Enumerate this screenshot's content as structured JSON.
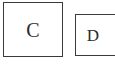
{
  "canvas": {
    "width": 115,
    "height": 64,
    "background_color": "#ffffff"
  },
  "diagram": {
    "title": "",
    "kind": "labeled-box-pair",
    "border_color": "#3a3a3a",
    "label_color": "#2b2b2b",
    "nodes": [
      {
        "id": "c",
        "label": "C",
        "x": 3,
        "y": 2,
        "width": 60,
        "height": 55,
        "fill": "#ffffff",
        "clipped": false
      },
      {
        "id": "d",
        "label": "D",
        "x": 75,
        "y": 14,
        "width": 48,
        "height": 42,
        "fill": "#ffffff",
        "clipped": true
      }
    ]
  }
}
